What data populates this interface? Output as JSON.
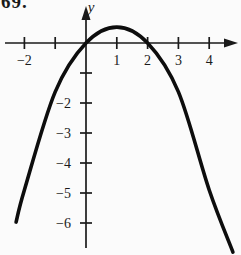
{
  "figure": {
    "problem_number": "69.",
    "y_axis_label": "y",
    "colors": {
      "ink": "#1a1a1a",
      "background": "#fbfbfb"
    }
  },
  "chart_data": {
    "type": "line",
    "title": "",
    "xlabel": "",
    "ylabel": "y",
    "vertex": [
      1,
      0.53
    ],
    "x_intercepts": [
      0,
      2
    ],
    "points": [
      [
        -2.27,
        -5.97
      ],
      [
        -2.0,
        -4.9
      ],
      [
        -1.0,
        -1.63
      ],
      [
        0.0,
        0.0
      ],
      [
        1.0,
        0.53
      ],
      [
        2.0,
        0.0
      ],
      [
        3.0,
        -1.63
      ],
      [
        4.0,
        -4.9
      ],
      [
        4.77,
        -6.97
      ]
    ],
    "x_ticks": [
      {
        "value": -2,
        "label": "−2"
      },
      {
        "value": -1,
        "label": ""
      },
      {
        "value": 1,
        "label": "1"
      },
      {
        "value": 2,
        "label": "2"
      },
      {
        "value": 3,
        "label": "3"
      },
      {
        "value": 4,
        "label": "4"
      }
    ],
    "y_ticks": [
      {
        "value": -1,
        "label": ""
      },
      {
        "value": -2,
        "label": "−2"
      },
      {
        "value": -3,
        "label": "−3"
      },
      {
        "value": -4,
        "label": "−4"
      },
      {
        "value": -5,
        "label": "−5"
      },
      {
        "value": -6,
        "label": "−6"
      }
    ],
    "xlim": [
      -2.6,
      4.9
    ],
    "ylim": [
      -7.1,
      1.2
    ],
    "grid": false,
    "legend": false
  }
}
